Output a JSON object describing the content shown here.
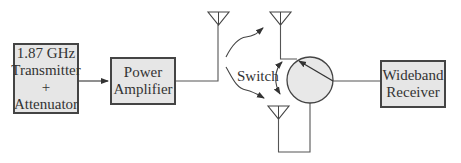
{
  "diagram": {
    "blocks": {
      "transmitter": {
        "lines": [
          "1.87 GHz",
          "Transmitter",
          "+",
          "Attenuator"
        ]
      },
      "power_amplifier": {
        "lines": [
          "Power",
          "Amplifier"
        ]
      },
      "receiver": {
        "lines": [
          "Wideband",
          "Receiver"
        ]
      }
    },
    "switch_label": "Switch",
    "elements": [
      "transmit-antenna",
      "receive-antenna-upper",
      "receive-antenna-lower",
      "rotary-switch"
    ],
    "colors": {
      "box_fill": "#e6e6e6",
      "box_border": "#444444",
      "line": "#444444",
      "switch_fill": "#e8e8e8",
      "text": "#333333"
    }
  }
}
